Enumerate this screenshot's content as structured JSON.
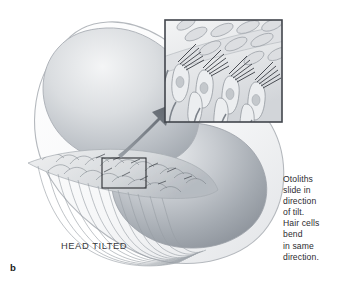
{
  "figure": {
    "panel_letter": "b",
    "condition_label": "HEAD TILTED",
    "caption_lines": [
      "Otoliths",
      "slide in",
      "direction",
      "of tilt.",
      "Hair cells",
      "bend",
      "in same",
      "direction."
    ],
    "caption_text": "Otoliths slide in direction of tilt. Hair cells bend in same direction."
  },
  "colors": {
    "background": "#ffffff",
    "text": "#2c2c30",
    "label_text": "#39393d",
    "panel_letter": "#1c1c20",
    "membrane_outline": "#b9bcc0",
    "chamber_light": "#f2f3f4",
    "chamber_mid": "#c9ccd0",
    "chamber_dark": "#9aa0a6",
    "lobe_dark": "#8e949b",
    "inset_border": "#4a4e55",
    "callout_border": "#2b2d31",
    "arrow": "#6e747c",
    "hair_cell_fill": "#e9eaec",
    "otolith_fill": "#dcdee1",
    "nerve_fiber": "#8b9198"
  },
  "anatomy": {
    "structure_name": "utricle-macula",
    "parts": [
      {
        "name": "membranous-labyrinth-wall",
        "kind": "outline"
      },
      {
        "name": "utricle-chamber-upper-lobe",
        "kind": "gradient-mass"
      },
      {
        "name": "utricle-chamber-lower-lobe",
        "kind": "gradient-mass"
      },
      {
        "name": "macula-otolithic-membrane",
        "kind": "textured-band"
      },
      {
        "name": "hair-cell-layer",
        "kind": "textured-band"
      },
      {
        "name": "vestibular-nerve-fibers",
        "kind": "fiber-bundle"
      }
    ]
  },
  "callout": {
    "source_box": {
      "x": 102,
      "y": 158,
      "width": 44,
      "height": 30
    },
    "inset_box": {
      "x": 165,
      "y": 20,
      "width": 117,
      "height": 102
    },
    "arrow": {
      "from_x": 120,
      "from_y": 152,
      "to_x": 166,
      "to_y": 108
    }
  }
}
